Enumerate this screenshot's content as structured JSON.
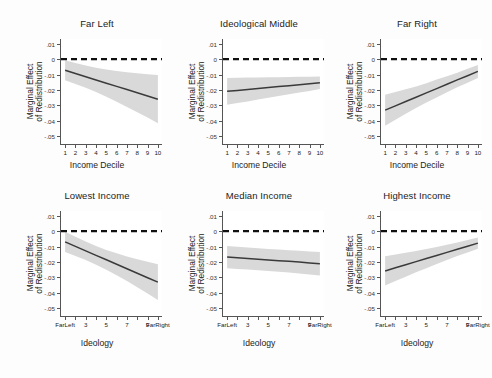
{
  "figure": {
    "background_color": "#fdfdfd",
    "panel_background": "#ffffff",
    "line_color": "#3a3a3a",
    "band_color": "#d9d9d9",
    "zero_line_color": "#111111",
    "axis_color": "#555555"
  },
  "shared": {
    "ylabel_line1": "Marginal Effect",
    "ylabel_line2": "of Redistribution",
    "yticks": [
      ".01",
      "0",
      "-.01",
      "-.02",
      "-.03",
      "-.04",
      "-.05"
    ],
    "ytick_values": [
      0.01,
      0,
      -0.01,
      -0.02,
      -0.03,
      -0.04,
      -0.05
    ],
    "ylim": [
      -0.055,
      0.013
    ],
    "xlabel_top": "Income Decile",
    "xlabel_bottom": "Ideology",
    "xticks_top": [
      "1",
      "2",
      "3",
      "4",
      "5",
      "6",
      "7",
      "8",
      "9",
      "10"
    ],
    "xticks_bottom": [
      "Far\nLeft",
      "3",
      "5",
      "7",
      "9",
      "Far\nRight"
    ],
    "xticks_bottom_positions": [
      1,
      3,
      5,
      7,
      9,
      10
    ],
    "xlim": [
      0.6,
      10.4
    ]
  },
  "chart_data": [
    {
      "type": "line",
      "panel": "top-left",
      "title": "Far Left",
      "xlabel": "Income Decile",
      "ylabel": "Marginal Effect of Redistribution",
      "xlim": [
        0.6,
        10.4
      ],
      "ylim": [
        -0.055,
        0.013
      ],
      "grid": false,
      "zero_reference_line": 0,
      "x": [
        1,
        2,
        3,
        4,
        5,
        6,
        7,
        8,
        9,
        10
      ],
      "values": [
        -0.0072,
        -0.0093,
        -0.0114,
        -0.0135,
        -0.0156,
        -0.0177,
        -0.0197,
        -0.0218,
        -0.0239,
        -0.026
      ],
      "ci_upper": [
        -0.0007,
        -0.0025,
        -0.0042,
        -0.0056,
        -0.0068,
        -0.0077,
        -0.0085,
        -0.0092,
        -0.0098,
        -0.0103
      ],
      "ci_lower": [
        -0.0137,
        -0.0161,
        -0.0186,
        -0.0214,
        -0.0244,
        -0.0277,
        -0.031,
        -0.0344,
        -0.0379,
        -0.0415
      ]
    },
    {
      "type": "line",
      "panel": "top-middle",
      "title": "Ideological Middle",
      "xlabel": "Income Decile",
      "ylabel": "Marginal Effect of Redistribution",
      "xlim": [
        0.6,
        10.4
      ],
      "ylim": [
        -0.055,
        0.013
      ],
      "grid": false,
      "zero_reference_line": 0,
      "x": [
        1,
        2,
        3,
        4,
        5,
        6,
        7,
        8,
        9,
        10
      ],
      "values": [
        -0.0209,
        -0.0203,
        -0.0197,
        -0.019,
        -0.0184,
        -0.0178,
        -0.0172,
        -0.0166,
        -0.016,
        -0.0153
      ],
      "ci_upper": [
        -0.0122,
        -0.0121,
        -0.012,
        -0.0119,
        -0.0118,
        -0.0117,
        -0.0116,
        -0.0115,
        -0.0114,
        -0.0113
      ],
      "ci_lower": [
        -0.0296,
        -0.0285,
        -0.0274,
        -0.0261,
        -0.025,
        -0.0239,
        -0.0228,
        -0.0217,
        -0.0206,
        -0.0193
      ]
    },
    {
      "type": "line",
      "panel": "top-right",
      "title": "Far Right",
      "xlabel": "Income Decile",
      "ylabel": "Marginal Effect of Redistribution",
      "xlim": [
        0.6,
        10.4
      ],
      "ylim": [
        -0.055,
        0.013
      ],
      "grid": false,
      "zero_reference_line": 0,
      "x": [
        1,
        2,
        3,
        4,
        5,
        6,
        7,
        8,
        9,
        10
      ],
      "values": [
        -0.0331,
        -0.0303,
        -0.0275,
        -0.0247,
        -0.0219,
        -0.0191,
        -0.0163,
        -0.0135,
        -0.0108,
        -0.008
      ],
      "ci_upper": [
        -0.0231,
        -0.0213,
        -0.0196,
        -0.0177,
        -0.0156,
        -0.0133,
        -0.0111,
        -0.0088,
        -0.0063,
        -0.0038
      ],
      "ci_lower": [
        -0.0431,
        -0.0393,
        -0.0354,
        -0.0317,
        -0.0282,
        -0.0249,
        -0.0215,
        -0.0182,
        -0.0153,
        -0.0122
      ]
    },
    {
      "type": "line",
      "panel": "bottom-left",
      "title": "Lowest Income",
      "xlabel": "Ideology",
      "ylabel": "Marginal Effect of Redistribution",
      "xlim": [
        0.6,
        10.4
      ],
      "ylim": [
        -0.055,
        0.013
      ],
      "grid": false,
      "zero_reference_line": 0,
      "x": [
        1,
        2,
        3,
        4,
        5,
        6,
        7,
        8,
        9,
        10
      ],
      "values": [
        -0.007,
        -0.0099,
        -0.0128,
        -0.0157,
        -0.0186,
        -0.0215,
        -0.0244,
        -0.0273,
        -0.0302,
        -0.0331
      ],
      "ci_upper": [
        -0.0004,
        -0.0036,
        -0.0068,
        -0.0096,
        -0.0122,
        -0.0144,
        -0.0164,
        -0.0182,
        -0.0199,
        -0.0215
      ],
      "ci_lower": [
        -0.0136,
        -0.0162,
        -0.0188,
        -0.0218,
        -0.025,
        -0.0286,
        -0.0324,
        -0.0364,
        -0.0405,
        -0.0447
      ]
    },
    {
      "type": "line",
      "panel": "bottom-middle",
      "title": "Median Income",
      "xlabel": "Ideology",
      "ylabel": "Marginal Effect of Redistribution",
      "xlim": [
        0.6,
        10.4
      ],
      "ylim": [
        -0.055,
        0.013
      ],
      "grid": false,
      "zero_reference_line": 0,
      "x": [
        1,
        2,
        3,
        4,
        5,
        6,
        7,
        8,
        9,
        10
      ],
      "values": [
        -0.0168,
        -0.0173,
        -0.0177,
        -0.0182,
        -0.0187,
        -0.0192,
        -0.0196,
        -0.0201,
        -0.0206,
        -0.0211
      ],
      "ci_upper": [
        -0.0096,
        -0.0101,
        -0.0106,
        -0.0111,
        -0.0116,
        -0.012,
        -0.0124,
        -0.0128,
        -0.0132,
        -0.0136
      ],
      "ci_lower": [
        -0.024,
        -0.0245,
        -0.0249,
        -0.0254,
        -0.0259,
        -0.0264,
        -0.0269,
        -0.0275,
        -0.0281,
        -0.0287
      ]
    },
    {
      "type": "line",
      "panel": "bottom-right",
      "title": "Highest Income",
      "xlabel": "Ideology",
      "ylabel": "Marginal Effect of Redistribution",
      "xlim": [
        0.6,
        10.4
      ],
      "ylim": [
        -0.055,
        0.013
      ],
      "grid": false,
      "zero_reference_line": 0,
      "x": [
        1,
        2,
        3,
        4,
        5,
        6,
        7,
        8,
        9,
        10
      ],
      "values": [
        -0.0258,
        -0.0238,
        -0.0218,
        -0.0198,
        -0.0178,
        -0.0158,
        -0.0138,
        -0.0118,
        -0.0098,
        -0.0078
      ],
      "ci_upper": [
        -0.0163,
        -0.0152,
        -0.0141,
        -0.0129,
        -0.0116,
        -0.0103,
        -0.0089,
        -0.0074,
        -0.0058,
        -0.0041
      ],
      "ci_lower": [
        -0.0353,
        -0.0324,
        -0.0295,
        -0.0267,
        -0.024,
        -0.0213,
        -0.0187,
        -0.0162,
        -0.0138,
        -0.0115
      ]
    }
  ]
}
